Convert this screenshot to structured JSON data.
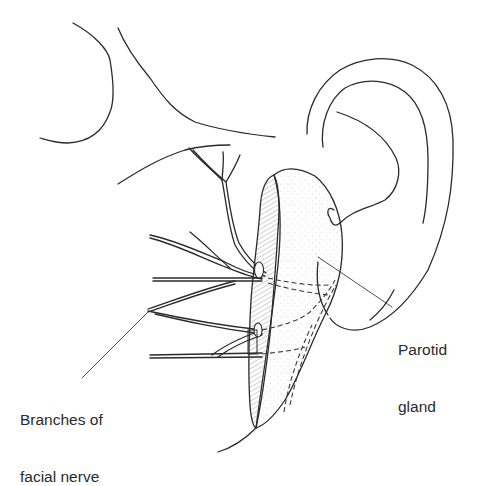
{
  "figure": {
    "type": "anatomical line drawing"
  },
  "labels": {
    "parotid": {
      "line1": "Parotid",
      "line2": "gland"
    },
    "nerve": {
      "line1": "Branches of",
      "line2": "facial nerve"
    }
  },
  "colors": {
    "ink": "#2a2a2a",
    "background": "#ffffff",
    "hatch": "#6a6a6a",
    "stipple": "#9a9a9a"
  }
}
